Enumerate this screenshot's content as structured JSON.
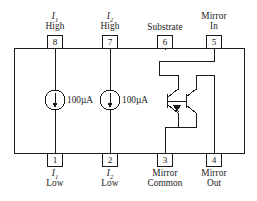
{
  "figure": {
    "type": "circuit-schematic",
    "package": {
      "outline": "rectangle",
      "pin_count": 8
    }
  },
  "colors": {
    "line": "#1a1a1a",
    "background": "#ffffff",
    "text": "#1a1a1a"
  },
  "pins": {
    "top": [
      {
        "number": "8",
        "label_line1": "I",
        "label_sub": "1",
        "label_line2": "High",
        "name": "i1-high"
      },
      {
        "number": "7",
        "label_line1": "I",
        "label_sub": "2",
        "label_line2": "High",
        "name": "i2-high"
      },
      {
        "number": "6",
        "label_line1": "Substrate",
        "label_sub": "",
        "label_line2": "",
        "name": "substrate"
      },
      {
        "number": "5",
        "label_line1": "Mirror",
        "label_sub": "",
        "label_line2": "In",
        "name": "mirror-in"
      }
    ],
    "bottom": [
      {
        "number": "1",
        "label_line1": "I",
        "label_sub": "1",
        "label_line2": "Low",
        "name": "i1-low"
      },
      {
        "number": "2",
        "label_line1": "I",
        "label_sub": "2",
        "label_line2": "Low",
        "name": "i2-low"
      },
      {
        "number": "3",
        "label_line1": "Mirror",
        "label_sub": "",
        "label_line2": "Common",
        "name": "mirror-common"
      },
      {
        "number": "4",
        "label_line1": "Mirror",
        "label_sub": "",
        "label_line2": "Out",
        "name": "mirror-out"
      }
    ]
  },
  "sources": [
    {
      "value": "100µA",
      "name": "current-source-1",
      "direction": "down"
    },
    {
      "value": "100µA",
      "name": "current-source-2",
      "direction": "down"
    }
  ],
  "mirror": {
    "device": "npn-transistor-pair",
    "transistor_left": "Q1",
    "transistor_right": "Q2"
  }
}
